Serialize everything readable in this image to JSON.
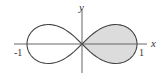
{
  "figure": {
    "title": "",
    "curve": "lemniscate",
    "x_axis_label": "x",
    "y_axis_label": "y",
    "tick_labels": {
      "left": "-1",
      "right": "1"
    },
    "shaded_region": "right lobe",
    "colors": {
      "curve": "#444444",
      "axis": "#555555",
      "fill": "#dcdcdc"
    }
  }
}
